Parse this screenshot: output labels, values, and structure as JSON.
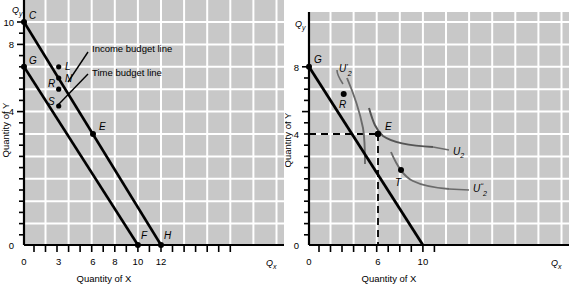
{
  "figure": {
    "panels": [
      {
        "id": "left",
        "axes": {
          "x_axis_title": "Quantity of X",
          "y_axis_title": "Quantity of Y",
          "x_axis_var": "Q",
          "x_axis_var_sub": "x",
          "y_axis_var": "Q",
          "y_axis_var_sub": "y",
          "x_ticks": [
            "0",
            "3",
            "6",
            "8",
            "10",
            "12"
          ],
          "y_ticks": [
            "0",
            "4",
            "8",
            "10"
          ],
          "x_range": [
            0,
            14
          ],
          "y_range": [
            0,
            11
          ]
        },
        "annotations": [
          {
            "name": "income-budget-line-label",
            "text": "Income budget line"
          },
          {
            "name": "time-budget-line-label",
            "text": "Time budget line"
          }
        ],
        "points": [
          {
            "label": "C",
            "x": 0,
            "y": 10,
            "filled": true
          },
          {
            "label": "G",
            "x": 0,
            "y": 8,
            "filled": true
          },
          {
            "label": "L",
            "x": 3,
            "y": 8,
            "filled": true
          },
          {
            "label": "N",
            "x": 3,
            "y": 7,
            "filled": true
          },
          {
            "label": "R",
            "x": 3,
            "y": 6,
            "filled": true
          },
          {
            "label": "S",
            "x": 3,
            "y": 4.5,
            "filled": true
          },
          {
            "label": "E",
            "x": 6,
            "y": 4,
            "filled": true
          },
          {
            "label": "F",
            "x": 10,
            "y": 0,
            "filled": true
          },
          {
            "label": "H",
            "x": 12,
            "y": 0,
            "filled": true
          }
        ],
        "lines": [
          {
            "name": "income-budget-line",
            "from": [
              0,
              10
            ],
            "to": [
              12,
              0
            ]
          },
          {
            "name": "time-budget-line",
            "from": [
              0,
              8
            ],
            "to": [
              10,
              0
            ]
          }
        ]
      },
      {
        "id": "right",
        "axes": {
          "x_axis_title": "Quantity of X",
          "y_axis_title": "Quantity of Y",
          "x_axis_var": "Q",
          "x_axis_var_sub": "x",
          "y_axis_var": "Q",
          "y_axis_var_sub": "y",
          "x_ticks": [
            "0",
            "6",
            "10"
          ],
          "y_ticks": [
            "0",
            "4",
            "8"
          ],
          "x_range": [
            0,
            14
          ],
          "y_range": [
            0,
            11
          ]
        },
        "points": [
          {
            "label": "G",
            "x": 0,
            "y": 8,
            "filled": true
          },
          {
            "label": "R",
            "x": 3,
            "y": 5.6,
            "filled": true
          },
          {
            "label": "E",
            "x": 6,
            "y": 4,
            "filled": true
          },
          {
            "label": "T",
            "x": 8,
            "y": 2.4,
            "filled": true
          }
        ],
        "lines": [
          {
            "name": "budget-line",
            "from": [
              0,
              8
            ],
            "to": [
              10,
              0
            ]
          }
        ],
        "guides": [
          {
            "name": "horizontal-guide-y4",
            "from": [
              0,
              4
            ],
            "to": [
              6,
              4
            ]
          },
          {
            "name": "vertical-guide-x6",
            "from": [
              6,
              0
            ],
            "to": [
              6,
              4
            ]
          }
        ],
        "curves": [
          {
            "name": "indifference-curve-u2-prime",
            "label_base": "U",
            "label_prime": "'",
            "label_sub": "2"
          },
          {
            "name": "indifference-curve-u2",
            "label_base": "U",
            "label_prime": "",
            "label_sub": "2"
          },
          {
            "name": "indifference-curve-u2-dprime",
            "label_base": "U",
            "label_prime": "ʺ",
            "label_sub": "2"
          }
        ]
      }
    ]
  },
  "style": {
    "plot_background": "#c8c8c8",
    "gridline_color": "#ffffff",
    "line_color": "#000000",
    "curve_color": "#555555",
    "page_background": "#ffffff"
  }
}
